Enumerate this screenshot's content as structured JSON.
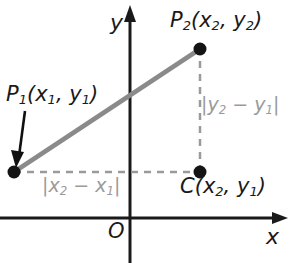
{
  "figure": {
    "colors": {
      "axis": "#1a1a1a",
      "segment": "#8a8a8a",
      "dashed": "#9a9a9a",
      "point": "#141414",
      "arrow": "#101010",
      "label_dark": "#1a1a1a",
      "label_gray": "#9a9a9a",
      "background": "#ffffff"
    },
    "axes": {
      "y_label": "y",
      "x_label": "x",
      "origin_label": "O"
    },
    "labels": {
      "p2": {
        "name": "P",
        "sub": "2",
        "coords_open": "(",
        "x": "x",
        "xsub": "2",
        "comma": ", ",
        "y": "y",
        "ysub": "2",
        "coords_close": ")"
      },
      "p1": {
        "name": "P",
        "sub": "1",
        "coords_open": "(",
        "x": "x",
        "xsub": "1",
        "comma": ", ",
        "y": "y",
        "ysub": "1",
        "coords_close": ")"
      },
      "c": {
        "name": "C",
        "sub": "",
        "coords_open": "(",
        "x": "x",
        "xsub": "2",
        "comma": ", ",
        "y": "y",
        "ysub": "1",
        "coords_close": ")"
      },
      "dx": {
        "open": "|",
        "a": "x",
        "asub": "2",
        "minus": " − ",
        "b": "x",
        "bsub": "1",
        "close": "|"
      },
      "dy": {
        "open": "|",
        "a": "y",
        "asub": "2",
        "minus": " − ",
        "b": "y",
        "bsub": "1",
        "close": "|"
      }
    },
    "points": {
      "p1": {
        "cx": 14,
        "cy": 172,
        "r": 6
      },
      "p2": {
        "cx": 200,
        "cy": 49,
        "r": 6
      },
      "c": {
        "cx": 200,
        "cy": 172,
        "r": 6
      }
    },
    "geometry": {
      "segment_width": 4,
      "dashed_pattern": "7,6",
      "y_axis_x": 130,
      "x_axis_y": 218
    }
  }
}
